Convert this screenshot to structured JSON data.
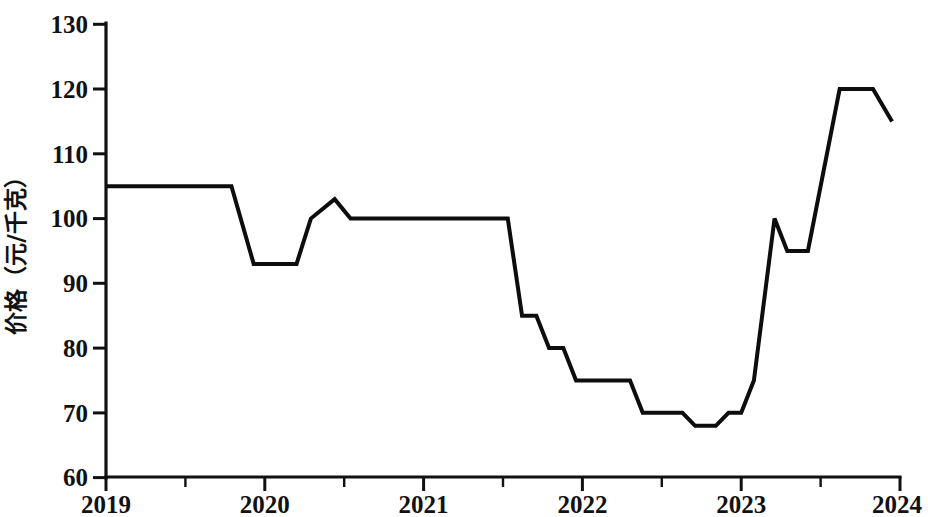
{
  "chart_data": {
    "type": "line",
    "title": "",
    "subtitle": "",
    "xlabel": "",
    "ylabel": "价格（元/千克）",
    "xlim": [
      2019.0,
      2024.0
    ],
    "ylim": [
      60,
      130
    ],
    "y_ticks": [
      60,
      70,
      80,
      90,
      100,
      110,
      120,
      130
    ],
    "y_tick_labels": [
      "60",
      "70",
      "80",
      "90",
      "100",
      "110",
      "120",
      "130"
    ],
    "x_ticks": [
      2019,
      2020,
      2021,
      2022,
      2023,
      2024
    ],
    "x_tick_labels": [
      "2019",
      "2020",
      "2021",
      "2022",
      "2023",
      "2024"
    ],
    "x_minor_ticks": [
      2019.5,
      2020.5,
      2021.5,
      2022.5,
      2023.5
    ],
    "grid": false,
    "legend": false,
    "legend_position": "none",
    "line_color": "#0d0d0d",
    "series": [
      {
        "name": "价格",
        "x": [
          2019.0,
          2019.79,
          2019.93,
          2020.2,
          2020.29,
          2020.44,
          2020.54,
          2021.53,
          2021.62,
          2021.71,
          2021.79,
          2021.88,
          2021.96,
          2022.3,
          2022.38,
          2022.63,
          2022.71,
          2022.84,
          2022.92,
          2023.0,
          2023.08,
          2023.21,
          2023.29,
          2023.42,
          2023.62,
          2023.71,
          2023.83,
          2023.95
        ],
        "values": [
          105,
          105,
          93,
          93,
          100,
          103,
          100,
          100,
          85,
          85,
          80,
          80,
          75,
          75,
          70,
          70,
          68,
          68,
          70,
          70,
          75,
          100,
          95,
          95,
          120,
          120,
          120,
          115
        ]
      }
    ],
    "annotations": []
  },
  "axes": {
    "y_axis_title": "价格（元/千克）"
  }
}
